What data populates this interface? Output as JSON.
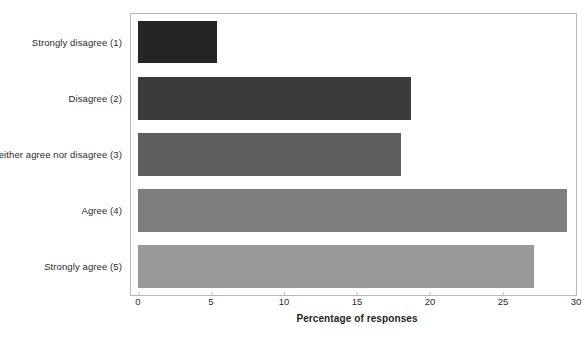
{
  "chart_data": {
    "type": "bar",
    "orientation": "horizontal",
    "title": "",
    "xlabel": "Percentage of responses",
    "ylabel": "",
    "categories": [
      "Strongly disagree (1)",
      "Disagree (2)",
      "Neither agree nor disagree (3)",
      "Agree (4)",
      "Strongly agree (5)"
    ],
    "values": [
      5.4,
      18.7,
      18.0,
      29.4,
      27.1
    ],
    "bar_colors": [
      "#252525",
      "#3b3b3b",
      "#5e5e5e",
      "#7e7e7e",
      "#999999"
    ],
    "xlim": [
      0,
      30
    ],
    "xticks": [
      0,
      5,
      10,
      15,
      20,
      25,
      30
    ],
    "xtick_labels": [
      "0",
      "5",
      "10",
      "15",
      "20",
      "25",
      "30"
    ],
    "grid": false,
    "legend": "none",
    "plot_border_color": "#b9b9b9"
  }
}
